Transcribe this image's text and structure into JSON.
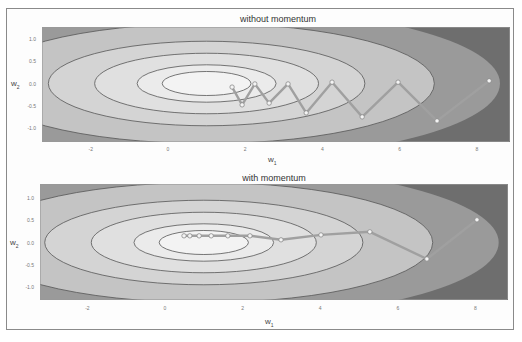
{
  "figure": {
    "frame": true
  },
  "chart_data": [
    {
      "type": "contour+line",
      "title": "without momentum",
      "xlabel": "w",
      "xlabel_sub": "1",
      "ylabel": "w",
      "ylabel_sub": "2",
      "xlim": [
        -3.3,
        8.8
      ],
      "ylim": [
        -1.3,
        1.3
      ],
      "xticks": [
        "-2",
        "0",
        "2",
        "4",
        "6",
        "8"
      ],
      "xtick_values": [
        -2,
        0,
        2,
        4,
        6,
        8
      ],
      "yticks": [
        "1.0",
        "0.5",
        "0.0",
        "-0.5",
        "-1.0"
      ],
      "ytick_values": [
        1.0,
        0.5,
        0.0,
        -0.5,
        -1.0
      ],
      "grid": false,
      "contour_center": [
        1.0,
        0.0
      ],
      "contour_levels": [
        {
          "rx": 11.0,
          "ry": 2.5,
          "fill": "#6e6e6e"
        },
        {
          "rx": 7.6,
          "ry": 1.72,
          "fill": "#9a9a9a"
        },
        {
          "rx": 5.9,
          "ry": 1.35,
          "fill": "#c4c4c4"
        },
        {
          "rx": 4.1,
          "ry": 0.95,
          "fill": "#d4d4d4"
        },
        {
          "rx": 2.9,
          "ry": 0.68,
          "fill": "#e0e0e0"
        },
        {
          "rx": 1.8,
          "ry": 0.42,
          "fill": "#ebebeb"
        },
        {
          "rx": 1.15,
          "ry": 0.27,
          "fill": "#f3f3f3"
        }
      ],
      "path_color": "#a0a0a0",
      "path": [
        [
          1.66,
          -0.08
        ],
        [
          1.92,
          -0.48
        ],
        [
          2.25,
          -0.01
        ],
        [
          2.62,
          -0.44
        ],
        [
          3.11,
          -0.01
        ],
        [
          3.58,
          -0.66
        ],
        [
          4.25,
          0.03
        ],
        [
          5.03,
          -0.75
        ],
        [
          5.96,
          0.03
        ],
        [
          6.97,
          -0.84
        ],
        [
          8.32,
          0.06
        ]
      ]
    },
    {
      "type": "contour+line",
      "title": "with momentum",
      "xlabel": "w",
      "xlabel_sub": "1",
      "ylabel": "w",
      "ylabel_sub": "2",
      "xlim": [
        -3.3,
        8.8
      ],
      "ylim": [
        -1.3,
        1.3
      ],
      "xticks": [
        "-2",
        "0",
        "2",
        "4",
        "6",
        "8"
      ],
      "xtick_values": [
        -2,
        0,
        2,
        4,
        6,
        8
      ],
      "yticks": [
        "1.0",
        "0.5",
        "0.0",
        "-0.5",
        "-1.0"
      ],
      "ytick_values": [
        1.0,
        0.5,
        0.0,
        -0.5,
        -1.0
      ],
      "grid": false,
      "contour_center": [
        1.0,
        0.0
      ],
      "contour_levels": [
        {
          "rx": 11.0,
          "ry": 2.5,
          "fill": "#6e6e6e"
        },
        {
          "rx": 7.6,
          "ry": 1.72,
          "fill": "#9a9a9a"
        },
        {
          "rx": 5.9,
          "ry": 1.35,
          "fill": "#c4c4c4"
        },
        {
          "rx": 4.1,
          "ry": 0.95,
          "fill": "#d4d4d4"
        },
        {
          "rx": 2.9,
          "ry": 0.68,
          "fill": "#e0e0e0"
        },
        {
          "rx": 1.8,
          "ry": 0.42,
          "fill": "#ebebeb"
        },
        {
          "rx": 1.15,
          "ry": 0.27,
          "fill": "#f3f3f3"
        }
      ],
      "path_color": "#a0a0a0",
      "path": [
        [
          0.49,
          0.15
        ],
        [
          0.64,
          0.15
        ],
        [
          0.88,
          0.15
        ],
        [
          1.19,
          0.15
        ],
        [
          1.62,
          0.15
        ],
        [
          2.19,
          0.15
        ],
        [
          2.99,
          0.06
        ],
        [
          4.02,
          0.17
        ],
        [
          5.28,
          0.24
        ],
        [
          6.75,
          -0.37
        ],
        [
          8.04,
          0.51
        ]
      ]
    }
  ]
}
